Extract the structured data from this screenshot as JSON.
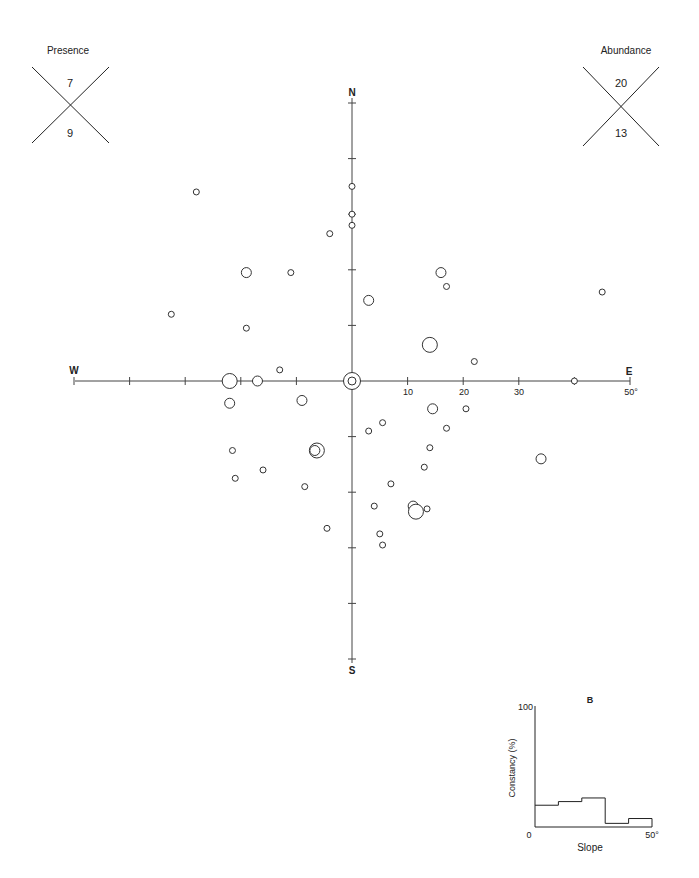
{
  "chart_data": [
    {
      "type": "scatter",
      "title": "Aspect/slope polar diagram",
      "axes": {
        "north_label": "N",
        "south_label": "S",
        "east_label": "E",
        "west_label": "W",
        "radial_ticks": [
          10,
          20,
          30
        ],
        "radial_max_label": "50°",
        "radial_tick_labels": [
          "10",
          "20",
          "30"
        ],
        "radial_range": [
          0,
          50
        ],
        "units": "degrees slope"
      },
      "size_legend_note": "circle size proportional to abundance (small, medium, large)",
      "points": [
        {
          "x": -28,
          "y": 34,
          "size": "small"
        },
        {
          "x": 0,
          "y": 35,
          "size": "small"
        },
        {
          "x": 0,
          "y": 30,
          "size": "small"
        },
        {
          "x": 0,
          "y": 28,
          "size": "small"
        },
        {
          "x": -4,
          "y": 26.5,
          "size": "small"
        },
        {
          "x": -19,
          "y": 19.5,
          "size": "medium"
        },
        {
          "x": -11,
          "y": 19.5,
          "size": "small"
        },
        {
          "x": 16,
          "y": 19.5,
          "size": "medium"
        },
        {
          "x": 17,
          "y": 17,
          "size": "small"
        },
        {
          "x": 45,
          "y": 16,
          "size": "small"
        },
        {
          "x": 3,
          "y": 14.5,
          "size": "medium"
        },
        {
          "x": -32.5,
          "y": 12,
          "size": "small"
        },
        {
          "x": -19,
          "y": 9.5,
          "size": "small"
        },
        {
          "x": 14,
          "y": 6.5,
          "size": "large"
        },
        {
          "x": 22,
          "y": 3.5,
          "size": "small"
        },
        {
          "x": -13,
          "y": 2,
          "size": "small"
        },
        {
          "x": 0,
          "y": 0,
          "size": "center-double"
        },
        {
          "x": -22,
          "y": 0,
          "size": "large"
        },
        {
          "x": -17,
          "y": 0,
          "size": "medium"
        },
        {
          "x": 40,
          "y": 0,
          "size": "small"
        },
        {
          "x": -22,
          "y": -4,
          "size": "medium"
        },
        {
          "x": -9,
          "y": -3.5,
          "size": "medium"
        },
        {
          "x": 14.5,
          "y": -5,
          "size": "medium"
        },
        {
          "x": 20.5,
          "y": -5,
          "size": "small"
        },
        {
          "x": 3,
          "y": -9,
          "size": "small"
        },
        {
          "x": 5.5,
          "y": -7.5,
          "size": "small"
        },
        {
          "x": 17,
          "y": -8.5,
          "size": "small"
        },
        {
          "x": 14,
          "y": -12,
          "size": "small"
        },
        {
          "x": -6.5,
          "y": -12.5,
          "size": "large-double"
        },
        {
          "x": -21.5,
          "y": -12.5,
          "size": "small"
        },
        {
          "x": 34,
          "y": -14,
          "size": "medium"
        },
        {
          "x": 13,
          "y": -15.5,
          "size": "small"
        },
        {
          "x": -16,
          "y": -16,
          "size": "small"
        },
        {
          "x": -21,
          "y": -17.5,
          "size": "small"
        },
        {
          "x": 7,
          "y": -18.5,
          "size": "small"
        },
        {
          "x": -8.5,
          "y": -19,
          "size": "small"
        },
        {
          "x": 4,
          "y": -22.5,
          "size": "small"
        },
        {
          "x": 11,
          "y": -22.5,
          "size": "medium"
        },
        {
          "x": 11.5,
          "y": -23.5,
          "size": "large"
        },
        {
          "x": 13.5,
          "y": -23,
          "size": "small"
        },
        {
          "x": -4.5,
          "y": -26.5,
          "size": "small"
        },
        {
          "x": 5,
          "y": -27.5,
          "size": "small"
        },
        {
          "x": 5.5,
          "y": -29.5,
          "size": "small"
        }
      ]
    },
    {
      "type": "line",
      "title": "B",
      "xlabel": "Slope",
      "ylabel": "Constancy (%)",
      "x_tick_labels": [
        "0",
        "50°"
      ],
      "y_tick_labels": [
        "0",
        "100"
      ],
      "xlim": [
        0,
        50
      ],
      "ylim": [
        0,
        100
      ],
      "step": true,
      "bins": [
        {
          "from": 0,
          "to": 10,
          "value": 18
        },
        {
          "from": 10,
          "to": 20,
          "value": 21
        },
        {
          "from": 20,
          "to": 30,
          "value": 24
        },
        {
          "from": 30,
          "to": 40,
          "value": 3
        },
        {
          "from": 40,
          "to": 50,
          "value": 7
        }
      ]
    }
  ],
  "presence": {
    "label": "Presence",
    "top": "7",
    "bottom": "9"
  },
  "abundance": {
    "label": "Abundance",
    "top": "20",
    "bottom": "13"
  },
  "histogram": {
    "panel_label": "B",
    "y_max_label": "100",
    "y_min_label": "0",
    "x_max_label": "50°",
    "x_label": "Slope",
    "y_label": "Constancy (%)"
  },
  "polar": {
    "n": "N",
    "s": "S",
    "e": "E",
    "w": "W",
    "t10": "10",
    "t20": "20",
    "t30": "30",
    "t50": "50°"
  }
}
